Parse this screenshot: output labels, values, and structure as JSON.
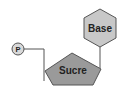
{
  "diagram": {
    "nodes": {
      "phosphate": {
        "label": "P",
        "shape": "circle"
      },
      "sugar": {
        "label": "Sucre",
        "shape": "pentagon"
      },
      "base": {
        "label": "Base",
        "shape": "hexagon"
      }
    },
    "edges": [
      {
        "from": "phosphate",
        "to": "sugar"
      },
      {
        "from": "sugar",
        "to": "base"
      }
    ],
    "colors": {
      "shape_fill": "#c8c8c8",
      "sugar_fill": "#9a9a9a",
      "stroke": "#555555",
      "text": "#222222",
      "background": "#ffffff"
    }
  }
}
